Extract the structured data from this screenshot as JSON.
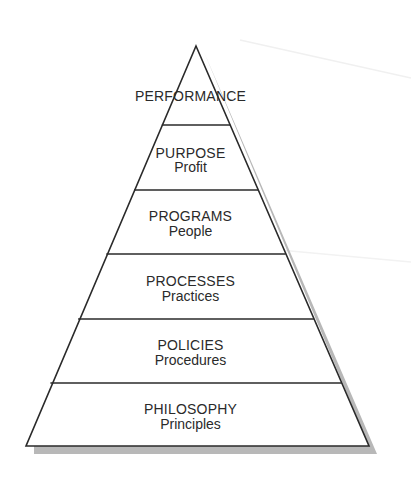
{
  "diagram": {
    "type": "pyramid",
    "colors": {
      "line": "#2a2a2a",
      "shadow": "#b8b8b8",
      "fill": "#ffffff",
      "text": "#2a2a2a"
    },
    "levels": [
      {
        "title": "PERFORMANCE",
        "subtitle": ""
      },
      {
        "title": "PURPOSE",
        "subtitle": "Profit"
      },
      {
        "title": "PROGRAMS",
        "subtitle": "People"
      },
      {
        "title": "PROCESSES",
        "subtitle": "Practices"
      },
      {
        "title": "POLICIES",
        "subtitle": "Procedures"
      },
      {
        "title": "PHILOSOPHY",
        "subtitle": "Principles"
      }
    ]
  }
}
